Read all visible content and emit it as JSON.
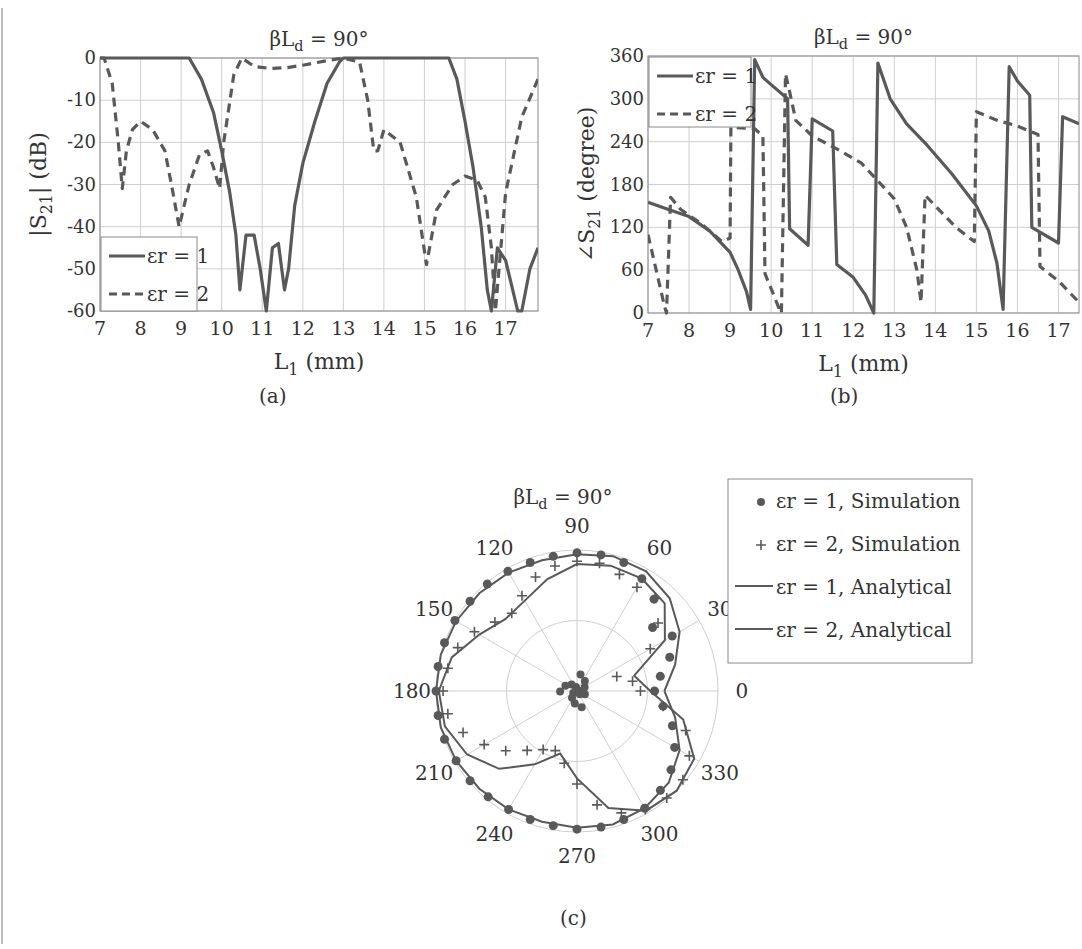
{
  "figure": {
    "captions": {
      "a": "(a)",
      "b": "(b)",
      "c": "(c)"
    },
    "colors": {
      "line": "#595959",
      "grid": "#cfcfcf",
      "axis": "#8a8a8a",
      "text": "#333333"
    }
  },
  "chart_data": [
    {
      "id": "a",
      "type": "line",
      "title": "βL_d = 90°",
      "title_parts": {
        "base": "βL",
        "sub": "d",
        "rest": " = 90°"
      },
      "xlabel": "L1 (mm)",
      "xlabel_parts": {
        "base": "L",
        "sub": "1",
        "rest": " (mm)"
      },
      "ylabel": "|S21| (dB)",
      "ylabel_parts": {
        "pre": "|S",
        "sub": "21",
        "rest": "| (dB)"
      },
      "xlim": [
        7,
        17.8
      ],
      "ylim": [
        -60,
        0
      ],
      "xticks": [
        7,
        8,
        9,
        10,
        11,
        12,
        13,
        14,
        15,
        16,
        17
      ],
      "yticks": [
        0,
        -10,
        -20,
        -30,
        -40,
        -50,
        -60
      ],
      "grid": true,
      "legend_position": "lower-left",
      "series": [
        {
          "name": "εr = 1",
          "style": "solid",
          "x": [
            7,
            8,
            9,
            9.2,
            9.5,
            9.8,
            10.0,
            10.2,
            10.35,
            10.45,
            10.6,
            10.8,
            10.95,
            11.1,
            11.25,
            11.4,
            11.55,
            11.65,
            11.8,
            12.0,
            12.3,
            12.6,
            12.9,
            13.0,
            14.0,
            15.0,
            15.6,
            15.8,
            16.0,
            16.2,
            16.4,
            16.55,
            16.65,
            16.8,
            17.0,
            17.2,
            17.3,
            17.4,
            17.6,
            17.8
          ],
          "values": [
            0,
            0,
            0,
            0,
            -5,
            -13,
            -22,
            -32,
            -42,
            -55,
            -42,
            -42,
            -50,
            -60,
            -45,
            -44,
            -55,
            -50,
            -35,
            -25,
            -15,
            -6,
            -1,
            0,
            0,
            0,
            0,
            -5,
            -15,
            -26,
            -40,
            -55,
            -60,
            -45,
            -48,
            -56,
            -60,
            -60,
            -50,
            -45
          ]
        },
        {
          "name": "εr = 2",
          "style": "dashed",
          "x": [
            7,
            7.1,
            7.3,
            7.45,
            7.55,
            7.65,
            7.8,
            8.0,
            8.3,
            8.6,
            8.8,
            8.95,
            9.2,
            9.45,
            9.65,
            9.8,
            9.95,
            10.05,
            10.3,
            10.5,
            10.8,
            11.2,
            11.6,
            12.0,
            12.5,
            13.0,
            13.4,
            13.6,
            13.75,
            13.85,
            14.0,
            14.4,
            14.8,
            15.05,
            15.3,
            15.7,
            16.0,
            16.3,
            16.5,
            16.65,
            16.75,
            17.0,
            17.4,
            17.8
          ],
          "values": [
            0,
            0,
            -6,
            -20,
            -31,
            -22,
            -17,
            -15,
            -17,
            -22,
            -32,
            -40,
            -30,
            -23,
            -22,
            -26,
            -31,
            -20,
            -4,
            0,
            -2,
            -2.5,
            -2.3,
            -1.7,
            -0.8,
            0,
            -1,
            -10,
            -22,
            -22,
            -17,
            -20,
            -33,
            -49,
            -36,
            -30,
            -28,
            -29,
            -33,
            -45,
            -60,
            -32,
            -14,
            -5
          ]
        }
      ]
    },
    {
      "id": "b",
      "type": "line",
      "title": "βL_d = 90°",
      "title_parts": {
        "base": "βL",
        "sub": "d",
        "rest": " = 90°"
      },
      "xlabel": "L1 (mm)",
      "xlabel_parts": {
        "base": "L",
        "sub": "1",
        "rest": " (mm)"
      },
      "ylabel": "∠S21 (degree)",
      "ylabel_parts": {
        "pre": "∠S",
        "sub": "21",
        "rest": " (degree)"
      },
      "xlim": [
        7,
        17.5
      ],
      "ylim": [
        0,
        360
      ],
      "xticks": [
        7,
        8,
        9,
        10,
        11,
        12,
        13,
        14,
        15,
        16,
        17
      ],
      "yticks": [
        0,
        60,
        120,
        180,
        240,
        300,
        360
      ],
      "grid": true,
      "legend_position": "upper-left",
      "series": [
        {
          "name": "εr = 1",
          "style": "solid",
          "x": [
            7,
            7.5,
            8,
            8.5,
            9,
            9.2,
            9.4,
            9.5,
            9.6,
            9.8,
            10.0,
            10.4,
            10.45,
            10.9,
            11.0,
            11.5,
            11.6,
            12.0,
            12.3,
            12.5,
            12.6,
            12.9,
            13.3,
            13.8,
            14.4,
            15.0,
            15.3,
            15.5,
            15.65,
            15.8,
            16.0,
            16.3,
            16.35,
            17.0,
            17.1,
            17.5
          ],
          "values": [
            155,
            145,
            135,
            115,
            85,
            60,
            30,
            5,
            355,
            330,
            320,
            300,
            118,
            95,
            272,
            255,
            68,
            50,
            25,
            0,
            350,
            300,
            265,
            235,
            195,
            150,
            115,
            70,
            5,
            345,
            325,
            305,
            120,
            98,
            275,
            265
          ]
        },
        {
          "name": "εr = 2",
          "style": "dashed",
          "x": [
            7,
            7.2,
            7.4,
            7.45,
            7.55,
            7.8,
            8.3,
            8.8,
            9.0,
            9.02,
            9.05,
            9.6,
            9.8,
            9.85,
            10.1,
            10.2,
            10.25,
            10.35,
            10.45,
            10.6,
            11.0,
            11.6,
            12.2,
            12.6,
            13.0,
            13.3,
            13.55,
            13.65,
            13.75,
            14.0,
            14.5,
            14.95,
            15.0,
            15.5,
            16.0,
            16.5,
            16.55,
            17.0,
            17.5
          ],
          "values": [
            110,
            60,
            10,
            0,
            162,
            145,
            125,
            100,
            105,
            260,
            260,
            258,
            248,
            55,
            20,
            5,
            0,
            335,
            310,
            270,
            248,
            230,
            210,
            185,
            160,
            120,
            60,
            15,
            165,
            150,
            120,
            100,
            282,
            270,
            262,
            250,
            65,
            45,
            15
          ]
        }
      ]
    },
    {
      "id": "c",
      "type": "polar",
      "title": "βL_d = 90°",
      "title_parts": {
        "base": "βL",
        "sub": "d",
        "rest": " = 90°"
      },
      "angle_ticks": [
        0,
        30,
        60,
        90,
        120,
        150,
        180,
        210,
        240,
        270,
        300,
        330
      ],
      "radial_rings": [
        0.5,
        1.0
      ],
      "radial_max": 1.0,
      "grid": true,
      "legend_position": "upper-right",
      "legend": [
        {
          "label": "εr = 1, Simulation",
          "marker": "dot"
        },
        {
          "label": "εr = 2, Simulation",
          "marker": "plus"
        },
        {
          "label": "εr = 1, Analytical",
          "marker": "line"
        },
        {
          "label": "εr = 2, Analytical",
          "marker": "line"
        }
      ],
      "series": [
        {
          "name": "εr = 1, Analytical",
          "style": "line",
          "theta_deg": [
            0,
            15,
            30,
            45,
            60,
            75,
            90,
            105,
            120,
            135,
            150,
            165,
            180,
            195,
            210,
            225,
            240,
            255,
            270,
            285,
            300,
            315,
            330,
            345
          ],
          "r": [
            0.62,
            0.72,
            0.84,
            0.93,
            0.98,
            0.99,
            0.97,
            0.96,
            0.97,
            0.98,
            0.99,
            1.0,
            1.0,
            1.0,
            0.99,
            0.98,
            0.97,
            0.96,
            0.97,
            0.98,
            0.96,
            0.92,
            0.84,
            0.72
          ]
        },
        {
          "name": "εr = 2, Analytical",
          "style": "line",
          "theta_deg": [
            0,
            15,
            30,
            45,
            60,
            75,
            90,
            105,
            120,
            135,
            150,
            165,
            180,
            195,
            210,
            225,
            240,
            255,
            270,
            285,
            300,
            315,
            330,
            345
          ],
          "r": [
            0.52,
            0.42,
            0.72,
            0.88,
            0.92,
            0.92,
            0.9,
            0.82,
            0.74,
            0.72,
            0.8,
            0.92,
            0.98,
            0.97,
            0.9,
            0.78,
            0.6,
            0.46,
            0.62,
            0.86,
            0.98,
            1.0,
            0.96,
            0.78
          ]
        },
        {
          "name": "εr = 1, Simulation",
          "style": "dot",
          "theta_deg": [
            0,
            10,
            20,
            30,
            40,
            50,
            60,
            70,
            80,
            90,
            100,
            110,
            120,
            130,
            140,
            150,
            160,
            170,
            180,
            190,
            200,
            210,
            220,
            230,
            240,
            250,
            260,
            270,
            280,
            290,
            300,
            310,
            320,
            330,
            340,
            350
          ],
          "r": [
            0.55,
            0.6,
            0.7,
            0.78,
            0.7,
            0.85,
            0.92,
            0.97,
            0.98,
            0.98,
            0.97,
            0.97,
            0.98,
            0.99,
            0.99,
            1.0,
            1.0,
            1.0,
            1.0,
            1.0,
            1.0,
            0.99,
            0.99,
            0.98,
            0.97,
            0.97,
            0.97,
            0.98,
            0.98,
            0.97,
            0.96,
            0.92,
            0.87,
            0.8,
            0.72,
            0.62
          ]
        },
        {
          "name": "εr = 2, Simulation",
          "style": "plus",
          "theta_deg": [
            0,
            10,
            20,
            30,
            40,
            50,
            60,
            70,
            80,
            90,
            100,
            110,
            120,
            130,
            140,
            150,
            160,
            170,
            180,
            190,
            200,
            210,
            220,
            230,
            240,
            250,
            260,
            270,
            280,
            290,
            300,
            310,
            320,
            330,
            340,
            350
          ],
          "r": [
            0.45,
            0.4,
            0.3,
            0.6,
            0.75,
            0.86,
            0.85,
            0.88,
            0.92,
            0.92,
            0.9,
            0.86,
            0.78,
            0.72,
            0.76,
            0.84,
            0.9,
            0.93,
            0.95,
            0.93,
            0.86,
            0.76,
            0.66,
            0.55,
            0.48,
            0.45,
            0.52,
            0.66,
            0.82,
            0.92,
            0.97,
            0.99,
            0.98,
            0.92,
            0.82,
            0.62
          ]
        }
      ]
    }
  ]
}
